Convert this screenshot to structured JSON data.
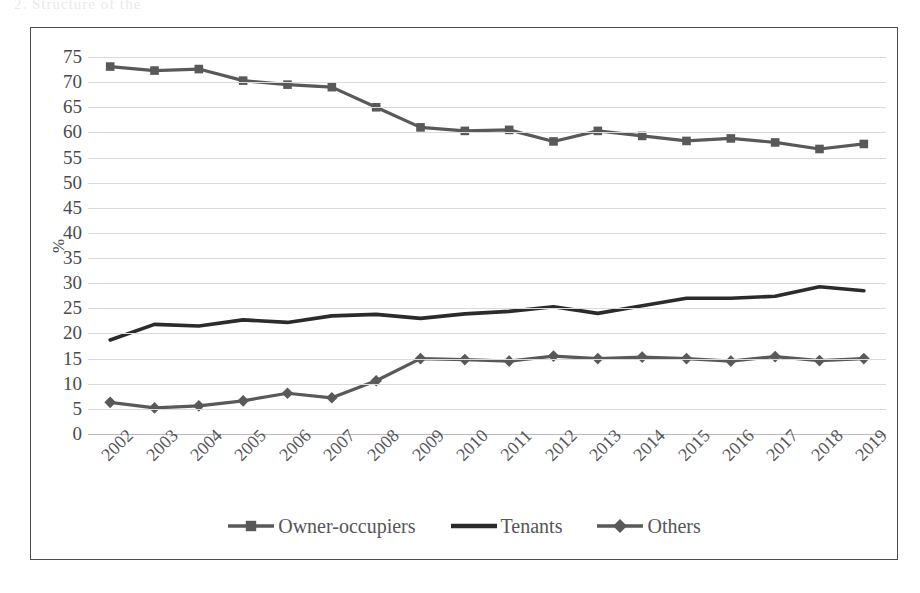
{
  "page": {
    "scan_artifact_text": "2.  Structure of the"
  },
  "chart_data": {
    "type": "line",
    "title": "",
    "subtitle": "",
    "xlabel": "",
    "ylabel": "%",
    "ylim": [
      0,
      75
    ],
    "ytick_step": 5,
    "yticks": [
      75,
      70,
      65,
      60,
      55,
      50,
      45,
      40,
      35,
      30,
      25,
      20,
      15,
      10,
      5,
      0
    ],
    "grid": true,
    "legend_position": "bottom",
    "categories": [
      "2002",
      "2003",
      "2004",
      "2005",
      "2006",
      "2007",
      "2008",
      "2009",
      "2010",
      "2011",
      "2012",
      "2013",
      "2014",
      "2015",
      "2016",
      "2017",
      "2018",
      "2019"
    ],
    "series": [
      {
        "name": "Owner-occupiers",
        "marker": "square",
        "color": "#595959",
        "values": [
          73.1,
          72.3,
          72.6,
          70.3,
          69.5,
          69.0,
          65.0,
          61.0,
          60.3,
          60.5,
          58.2,
          60.3,
          59.3,
          58.3,
          58.8,
          58.0,
          56.7,
          57.7
        ]
      },
      {
        "name": "Tenants",
        "marker": "none",
        "color": "#2b2b2b",
        "values": [
          18.7,
          21.8,
          21.5,
          22.7,
          22.2,
          23.5,
          23.8,
          23.0,
          23.9,
          24.4,
          25.3,
          24.0,
          25.5,
          27.0,
          27.0,
          27.4,
          29.3,
          28.5
        ]
      },
      {
        "name": "Others",
        "marker": "diamond",
        "color": "#595959",
        "values": [
          6.3,
          5.2,
          5.6,
          6.6,
          8.1,
          7.2,
          10.6,
          15.0,
          14.8,
          14.5,
          15.5,
          15.0,
          15.3,
          15.0,
          14.5,
          15.4,
          14.6,
          15.0
        ]
      }
    ]
  },
  "legend": {
    "items": [
      {
        "label": "Owner-occupiers",
        "marker": "square",
        "color": "#595959"
      },
      {
        "label": "Tenants",
        "marker": "none",
        "color": "#2b2b2b"
      },
      {
        "label": "Others",
        "marker": "diamond",
        "color": "#595959"
      }
    ]
  }
}
